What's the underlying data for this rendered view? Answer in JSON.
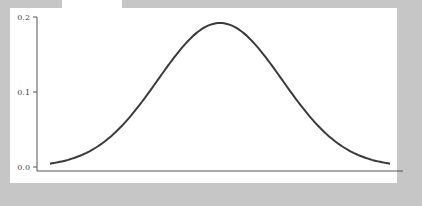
{
  "chart_data": {
    "type": "line",
    "title": "",
    "xlabel": "",
    "ylabel": "",
    "ylim": [
      0.0,
      0.2
    ],
    "yticks": [
      "0.0",
      "0.1",
      "0.2"
    ],
    "xticks": [],
    "grid": false,
    "legend": null,
    "series": [
      {
        "name": "density",
        "color": "#3a3a3a",
        "x": [
          0,
          1,
          2,
          3,
          4,
          5,
          6,
          7,
          8,
          9,
          10,
          11,
          12,
          13,
          14,
          15,
          16,
          17,
          18,
          19,
          20
        ],
        "values": [
          0.003,
          0.006,
          0.012,
          0.022,
          0.038,
          0.06,
          0.087,
          0.117,
          0.148,
          0.173,
          0.19,
          0.19,
          0.173,
          0.148,
          0.117,
          0.087,
          0.06,
          0.038,
          0.022,
          0.012,
          0.006
        ]
      }
    ]
  },
  "axis": {
    "y_labels": [
      "0.2",
      "0.1",
      "0.0"
    ]
  },
  "colors": {
    "background": "#c6c6c6",
    "panel": "#ffffff",
    "line": "#3a3a3a",
    "axis": "#555555"
  }
}
